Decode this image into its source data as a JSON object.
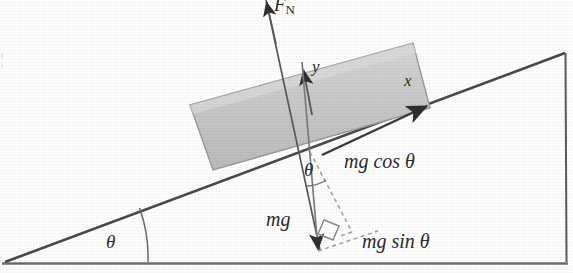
{
  "figure": {
    "type": "physics-free-body-diagram",
    "canvas": {
      "width": 573,
      "height": 273
    },
    "colors": {
      "line": "#4a4a4a",
      "block_fill": "#c9c9c9",
      "block_stroke": "#8f8f8f",
      "ground": "#7a7a7a",
      "text": "#2b2b2b",
      "dashed": "#8a8a8a"
    }
  },
  "labels": {
    "normal_force": "F",
    "normal_force_sub": "N",
    "axis_y": "y",
    "axis_x": "x",
    "weight": "mg",
    "component_normal": "mg cos θ",
    "component_parallel": "mg sin θ",
    "angle_at_block": "θ",
    "angle_at_base": "θ"
  },
  "geometry": {
    "incline_angle_deg": 20.5,
    "ramp": {
      "apex_left": [
        5,
        262
      ],
      "top_right": [
        565,
        53
      ],
      "bottom_right": [
        567,
        262
      ]
    },
    "ground_line": {
      "from": [
        2,
        263
      ],
      "to": [
        567,
        263
      ]
    },
    "block": {
      "corners": [
        [
          190,
          105
        ],
        [
          413,
          43
        ],
        [
          430,
          108
        ],
        [
          213,
          170
        ]
      ],
      "rotation_deg": -20.5
    },
    "vectors": {
      "normal": {
        "from": [
          318,
          250
        ],
        "to": [
          268,
          2
        ],
        "arrow_at_mid": [
          303,
          74
        ]
      },
      "weight": {
        "from": [
          301,
          60
        ],
        "to": [
          318,
          252
        ]
      },
      "x_axis": {
        "from": [
          330,
          152
        ],
        "to": [
          428,
          106
        ]
      }
    },
    "dashed": {
      "mg_cos_theta": {
        "from": [
          312,
          158
        ],
        "to": [
          348,
          224
        ]
      },
      "mg_sin_theta": {
        "from": [
          318,
          250
        ],
        "to": [
          370,
          232
        ]
      }
    },
    "right_angle_marker": [
      327,
      226
    ]
  }
}
